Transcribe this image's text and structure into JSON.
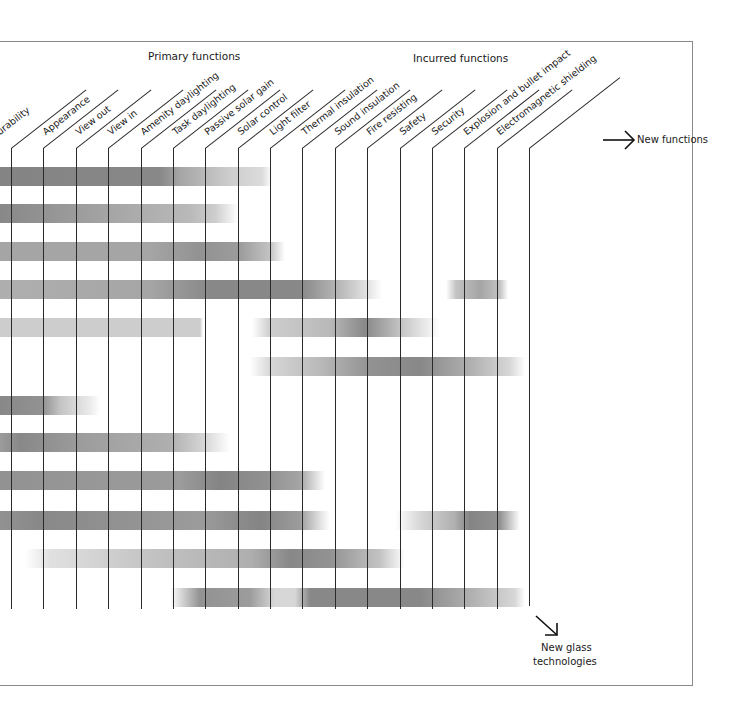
{
  "header": {
    "primary_group_label": "Primary functions",
    "incurred_group_label": "Incurred functions"
  },
  "columns": [
    {
      "label": "Durability",
      "visible_text": "urability",
      "x": 11
    },
    {
      "label": "Appearance",
      "x": 43
    },
    {
      "label": "View out",
      "x": 76
    },
    {
      "label": "View in",
      "x": 108
    },
    {
      "label": "Amenity daylighting",
      "x": 141
    },
    {
      "label": "Task daylighting",
      "x": 173
    },
    {
      "label": "Passive solar gain",
      "x": 205
    },
    {
      "label": "Solar control",
      "x": 238
    },
    {
      "label": "Light filter",
      "x": 270
    },
    {
      "label": "Thermal insulation",
      "x": 302
    },
    {
      "label": "Sound insulation",
      "x": 335
    },
    {
      "label": "Fire resisting",
      "x": 367
    },
    {
      "label": "Safety",
      "x": 400
    },
    {
      "label": "Security",
      "x": 432
    },
    {
      "label": "Explosion and bullet impact",
      "x": 464
    },
    {
      "label": "Electromagnetic shielding",
      "x": 497
    },
    {
      "label": "",
      "x": 529
    }
  ],
  "annotations": {
    "new_functions": "New functions",
    "new_glass_line1": "New glass",
    "new_glass_line2": "technologies"
  },
  "icons": {
    "right_arrow": "arrow-right-icon",
    "down_right_arrow": "arrow-down-right-icon"
  },
  "colors": {
    "bar_dark": "#6e6e6e",
    "bar_light": "#d6d6d6",
    "grid_line": "#2a2a2a",
    "frame": "#8a8a8a"
  },
  "chart_data": {
    "type": "heatmap",
    "title": "",
    "x_groups": [
      "Primary functions",
      "Incurred functions"
    ],
    "x_categories": [
      "Durability",
      "Appearance",
      "View out",
      "View in",
      "Amenity daylighting",
      "Task daylighting",
      "Passive solar gain",
      "Solar control",
      "Light filter",
      "Thermal insulation",
      "Sound insulation",
      "Fire resisting",
      "Safety",
      "Security",
      "Explosion and bullet impact",
      "Electromagnetic shielding"
    ],
    "axis_annotations": {
      "x": "New functions",
      "y": "New glass technologies"
    },
    "rows": [
      {
        "row": 1,
        "y": 167,
        "stops": [
          [
            0,
            0.62
          ],
          [
            160,
            0.6
          ],
          [
            180,
            0.45
          ],
          [
            230,
            0.25
          ],
          [
            262,
            0.18
          ],
          [
            272,
            0
          ]
        ]
      },
      {
        "row": 2,
        "y": 204,
        "stops": [
          [
            0,
            0.6
          ],
          [
            40,
            0.55
          ],
          [
            110,
            0.45
          ],
          [
            190,
            0.35
          ],
          [
            215,
            0.25
          ],
          [
            238,
            0
          ]
        ]
      },
      {
        "row": 3,
        "y": 242,
        "stops": [
          [
            0,
            0.45
          ],
          [
            150,
            0.45
          ],
          [
            200,
            0.55
          ],
          [
            240,
            0.5
          ],
          [
            270,
            0.3
          ],
          [
            285,
            0
          ]
        ]
      },
      {
        "row": 4,
        "y": 280,
        "stops": [
          [
            0,
            0.4
          ],
          [
            150,
            0.45
          ],
          [
            210,
            0.6
          ],
          [
            300,
            0.6
          ],
          [
            340,
            0.35
          ],
          [
            370,
            0.12
          ],
          [
            382,
            0
          ],
          [
            446,
            0
          ],
          [
            456,
            0.3
          ],
          [
            480,
            0.45
          ],
          [
            500,
            0.3
          ],
          [
            508,
            0
          ]
        ]
      },
      {
        "row": 5,
        "y": 318,
        "stops": [
          [
            0,
            0.25
          ],
          [
            200,
            0.25
          ],
          [
            203,
            0
          ],
          [
            252,
            0
          ],
          [
            270,
            0.25
          ],
          [
            330,
            0.35
          ],
          [
            365,
            0.6
          ],
          [
            400,
            0.3
          ],
          [
            440,
            0
          ]
        ]
      },
      {
        "row": 6,
        "y": 357,
        "stops": [
          [
            250,
            0
          ],
          [
            270,
            0.2
          ],
          [
            320,
            0.35
          ],
          [
            370,
            0.55
          ],
          [
            420,
            0.6
          ],
          [
            470,
            0.4
          ],
          [
            510,
            0.2
          ],
          [
            525,
            0
          ]
        ]
      },
      {
        "row": 7,
        "y": 396,
        "stops": [
          [
            0,
            0.6
          ],
          [
            43,
            0.55
          ],
          [
            60,
            0.3
          ],
          [
            90,
            0.1
          ],
          [
            100,
            0
          ]
        ]
      },
      {
        "row": 8,
        "y": 433,
        "stops": [
          [
            0,
            0.5
          ],
          [
            20,
            0.6
          ],
          [
            80,
            0.5
          ],
          [
            170,
            0.4
          ],
          [
            205,
            0.2
          ],
          [
            230,
            0
          ]
        ]
      },
      {
        "row": 9,
        "y": 471,
        "stops": [
          [
            0,
            0.55
          ],
          [
            180,
            0.5
          ],
          [
            220,
            0.62
          ],
          [
            270,
            0.55
          ],
          [
            300,
            0.45
          ],
          [
            325,
            0
          ]
        ]
      },
      {
        "row": 10,
        "y": 511,
        "stops": [
          [
            0,
            0.55
          ],
          [
            40,
            0.6
          ],
          [
            200,
            0.5
          ],
          [
            260,
            0.62
          ],
          [
            300,
            0.5
          ],
          [
            320,
            0.15
          ],
          [
            330,
            0
          ],
          [
            395,
            0
          ],
          [
            420,
            0.2
          ],
          [
            455,
            0.4
          ],
          [
            470,
            0.62
          ],
          [
            500,
            0.55
          ],
          [
            520,
            0
          ]
        ]
      },
      {
        "row": 11,
        "y": 549,
        "stops": [
          [
            25,
            0
          ],
          [
            50,
            0.15
          ],
          [
            150,
            0.3
          ],
          [
            250,
            0.4
          ],
          [
            290,
            0.6
          ],
          [
            330,
            0.55
          ],
          [
            380,
            0.3
          ],
          [
            405,
            0
          ]
        ]
      },
      {
        "row": 12,
        "y": 588,
        "stops": [
          [
            170,
            0
          ],
          [
            200,
            0.55
          ],
          [
            250,
            0.5
          ],
          [
            275,
            0.2
          ],
          [
            295,
            0.2
          ],
          [
            310,
            0.6
          ],
          [
            420,
            0.6
          ],
          [
            470,
            0.4
          ],
          [
            515,
            0.2
          ],
          [
            525,
            0
          ]
        ]
      }
    ]
  }
}
